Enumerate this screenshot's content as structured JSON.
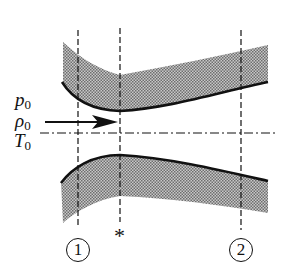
{
  "diagram": {
    "type": "converging-diverging nozzle (de Laval) cross-section",
    "inlet_labels": {
      "pressure": {
        "symbol": "p",
        "subscript": "0"
      },
      "density": {
        "symbol": "ρ",
        "subscript": "0"
      },
      "temperature": {
        "symbol": "T",
        "subscript": "0"
      }
    },
    "stations": [
      {
        "id": "station-1",
        "label": "1",
        "circled": true
      },
      {
        "id": "throat",
        "label": "*",
        "circled": false
      },
      {
        "id": "station-2",
        "label": "2",
        "circled": true
      }
    ],
    "flow_direction": "left-to-right",
    "colors": {
      "ink": "#111111",
      "wall_hatch": "#9a9a9a",
      "background": "#ffffff"
    }
  }
}
